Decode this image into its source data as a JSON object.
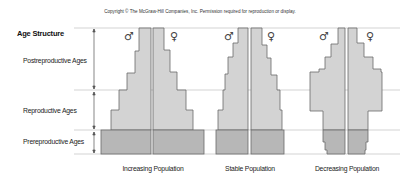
{
  "copyright": "Copyright © The McGraw-Hill Companies, Inc. Permission required for reproduction or display.",
  "axis": {
    "title": "Age Structure",
    "bands": [
      {
        "label": "Postreproductive Ages"
      },
      {
        "label": "Reproductive Ages"
      },
      {
        "label": "Prereproductive Ages"
      }
    ]
  },
  "symbols": {
    "male": "♂",
    "female": "♀"
  },
  "pyramids": [
    {
      "label": "Increasing Population"
    },
    {
      "label": "Stable Population"
    },
    {
      "label": "Decreasing Population"
    }
  ],
  "colors": {
    "fill_light": "#d3d3d3",
    "fill_dark": "#b7b7b7",
    "outline": "#6a6a6a",
    "grid": "#c8c8c8"
  }
}
